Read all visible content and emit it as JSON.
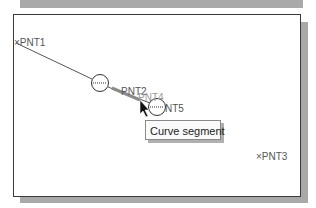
{
  "viewport": {
    "points": [
      {
        "id": "pnt1",
        "label": "×PNT1",
        "x": 14,
        "y": 38
      },
      {
        "id": "pnt2",
        "label": "PNT2",
        "x": 121,
        "y": 87
      },
      {
        "id": "pnt4",
        "label": "PNT4",
        "x": 138,
        "y": 93
      },
      {
        "id": "pnt5",
        "label": "NT5",
        "x": 165,
        "y": 104
      },
      {
        "id": "pnt3",
        "label": "×PNT3",
        "x": 256,
        "y": 152
      }
    ],
    "colors": {
      "line": "#555555",
      "highlight": "#8a8a8a",
      "border": "#3a3a3a",
      "shadow": "#a9a9a9"
    }
  },
  "tooltip": {
    "text": "Curve segment"
  }
}
